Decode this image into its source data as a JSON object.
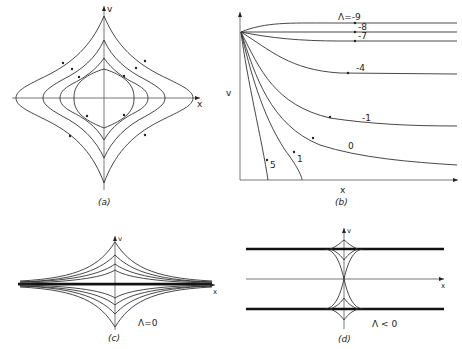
{
  "panels": {
    "a": {
      "caption": "(a)",
      "x_label": "x",
      "y_label": "v"
    },
    "b": {
      "caption": "(b)",
      "x_label": "x",
      "y_label": "v",
      "curve_labels": [
        "Λ=-9",
        "-8",
        "-7",
        "-4",
        "-1",
        "0",
        "1",
        "5"
      ]
    },
    "c": {
      "caption": "(c)",
      "x_label": "x",
      "y_label": "v",
      "condition": "Λ=0"
    },
    "d": {
      "caption": "(d)",
      "x_label": "x",
      "y_label": "v",
      "condition": "Λ < 0"
    }
  }
}
